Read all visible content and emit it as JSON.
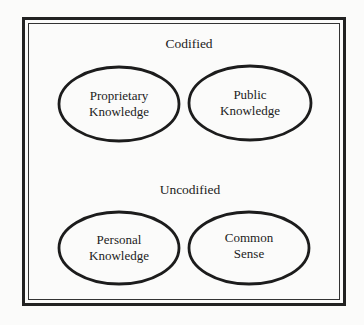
{
  "diagram": {
    "groups": [
      {
        "heading": "Codified",
        "nodes": [
          {
            "line1": "Proprietary",
            "line2": "Knowledge"
          },
          {
            "line1": "Public",
            "line2": "Knowledge"
          }
        ]
      },
      {
        "heading": "Uncodified",
        "nodes": [
          {
            "line1": "Personal",
            "line2": "Knowledge"
          },
          {
            "line1": "Common",
            "line2": "Sense"
          }
        ]
      }
    ],
    "colors": {
      "stroke": "#1c1c1c",
      "background": "#fbfbfa"
    }
  }
}
